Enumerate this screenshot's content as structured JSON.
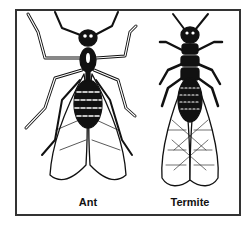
{
  "figure": {
    "type": "comparison-illustration",
    "colors": {
      "frame": "#333333",
      "ink": "#111111",
      "background": "#ffffff"
    },
    "insects": [
      {
        "name": "ant",
        "label": "Ant"
      },
      {
        "name": "termite",
        "label": "Termite"
      }
    ]
  }
}
